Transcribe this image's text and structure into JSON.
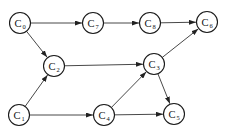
{
  "diagram": {
    "type": "directed-graph",
    "nodes": [
      {
        "id": "C0",
        "letter": "C",
        "sub": "0",
        "x": 20,
        "y": 23
      },
      {
        "id": "C7",
        "letter": "C",
        "sub": "7",
        "x": 93,
        "y": 23
      },
      {
        "id": "C8",
        "letter": "C",
        "sub": "8",
        "x": 150,
        "y": 23
      },
      {
        "id": "C6",
        "letter": "C",
        "sub": "6",
        "x": 207,
        "y": 22
      },
      {
        "id": "C2",
        "letter": "C",
        "sub": "2",
        "x": 54,
        "y": 66
      },
      {
        "id": "C3",
        "letter": "C",
        "sub": "3",
        "x": 154,
        "y": 64
      },
      {
        "id": "C1",
        "letter": "C",
        "sub": "1",
        "x": 19,
        "y": 115
      },
      {
        "id": "C4",
        "letter": "C",
        "sub": "4",
        "x": 104,
        "y": 115
      },
      {
        "id": "C5",
        "letter": "C",
        "sub": "5",
        "x": 174,
        "y": 114
      }
    ],
    "edges": [
      {
        "from": "C0",
        "to": "C7"
      },
      {
        "from": "C7",
        "to": "C8"
      },
      {
        "from": "C8",
        "to": "C6"
      },
      {
        "from": "C0",
        "to": "C2"
      },
      {
        "from": "C2",
        "to": "C3"
      },
      {
        "from": "C1",
        "to": "C2"
      },
      {
        "from": "C1",
        "to": "C4"
      },
      {
        "from": "C4",
        "to": "C3"
      },
      {
        "from": "C3",
        "to": "C6"
      },
      {
        "from": "C3",
        "to": "C5"
      },
      {
        "from": "C4",
        "to": "C5"
      }
    ],
    "node_radius": 10.5,
    "colors": {
      "stroke": "#1a1a1a",
      "edge": "#333333",
      "background": "#ffffff"
    }
  }
}
